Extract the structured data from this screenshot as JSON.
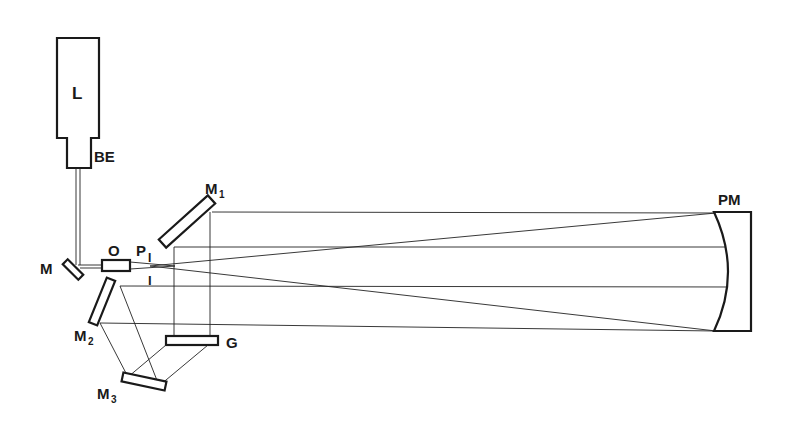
{
  "diagram": {
    "type": "optical-setup",
    "components": [
      {
        "id": "L",
        "label": "L",
        "description": "laser"
      },
      {
        "id": "BE",
        "label": "BE",
        "description": "beam expander"
      },
      {
        "id": "M",
        "label": "M",
        "description": "mirror"
      },
      {
        "id": "O",
        "label": "O",
        "description": "objective"
      },
      {
        "id": "P",
        "label": "P",
        "description": "pinhole"
      },
      {
        "id": "M1",
        "label": "M",
        "subscript": "1"
      },
      {
        "id": "M2",
        "label": "M",
        "subscript": "2"
      },
      {
        "id": "M3",
        "label": "M",
        "subscript": "3"
      },
      {
        "id": "G",
        "label": "G",
        "description": "grating"
      },
      {
        "id": "PM",
        "label": "PM",
        "description": "parabolic mirror"
      }
    ],
    "labels": {
      "L": "L",
      "BE": "BE",
      "M": "M",
      "O": "O",
      "P": "P",
      "I_top": "I",
      "I_bottom": "I",
      "M1": "M",
      "M1_sub": "1",
      "M2": "M",
      "M2_sub": "2",
      "M3": "M",
      "M3_sub": "3",
      "G": "G",
      "PM": "PM"
    },
    "colors": {
      "line": "#1a1a1a",
      "background": "#ffffff"
    }
  }
}
